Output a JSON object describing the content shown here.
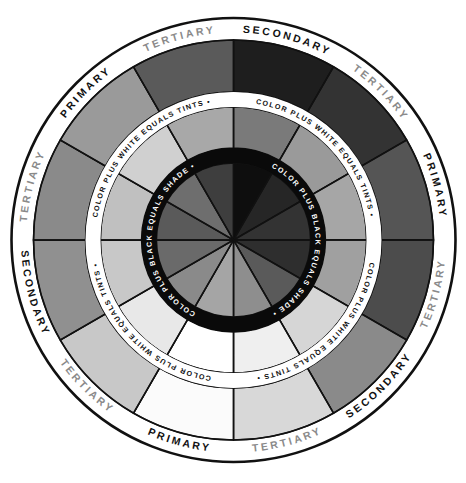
{
  "geometry": {
    "cx": 233.5,
    "cy": 240,
    "r_outer": 222,
    "r_label_inner": 200,
    "r_tint_outer": 148,
    "r_tint_text_inner": 133,
    "r_shade_outer": 92,
    "r_shade_inner": 77
  },
  "outer_labels": [
    {
      "text": "SECONDARY",
      "angle": 15,
      "color": "#111111"
    },
    {
      "text": "TERTIARY",
      "angle": 45,
      "color": "#8a8a8a"
    },
    {
      "text": "PRIMARY",
      "angle": 75,
      "color": "#111111"
    },
    {
      "text": "TERTIARY",
      "angle": 105,
      "color": "#8a8a8a"
    },
    {
      "text": "SECONDARY",
      "angle": 135,
      "color": "#111111"
    },
    {
      "text": "TERTIARY",
      "angle": 165,
      "color": "#8a8a8a"
    },
    {
      "text": "PRIMARY",
      "angle": 195,
      "color": "#111111"
    },
    {
      "text": "TERTIARY",
      "angle": 225,
      "color": "#8a8a8a"
    },
    {
      "text": "SECONDARY",
      "angle": 255,
      "color": "#111111"
    },
    {
      "text": "TERTIARY",
      "angle": 285,
      "color": "#8a8a8a"
    },
    {
      "text": "PRIMARY",
      "angle": 315,
      "color": "#111111"
    },
    {
      "text": "TERTIARY",
      "angle": 345,
      "color": "#8a8a8a"
    }
  ],
  "tint_ring_text": "COLOR PLUS WHITE EQUALS TINTS",
  "shade_ring_text": "COLOR PLUS BLACK EQUALS SHADE",
  "separator": "•",
  "segments": {
    "outer": [
      "#1e1e1e",
      "#333333",
      "#555555",
      "#4c4c4c",
      "#8a8a8a",
      "#d8d8d8",
      "#fbfbfb",
      "#c8c8c8",
      "#909090",
      "#8a8a8a",
      "#9a9a9a",
      "#5a5a5a"
    ],
    "tint": [
      "#7a7a7a",
      "#9a9a9a",
      "#a6a6a6",
      "#a0a0a0",
      "#d6d6d6",
      "#efefef",
      "#ffffff",
      "#e8e8e8",
      "#c8c8c8",
      "#c0c0c0",
      "#d0d0d0",
      "#a8a8a8"
    ],
    "shade": [
      "#0e0e0e",
      "#262626",
      "#333333",
      "#2e2e2e",
      "#5a5a5a",
      "#8e8e8e",
      "#a5a5a5",
      "#8a8a8a",
      "#6a6a6a",
      "#5a5a5a",
      "#6e6e6e",
      "#3e3e3e"
    ]
  },
  "colors": {
    "line": "#111111",
    "ring_white": "#ffffff",
    "ring_black": "#0a0a0a"
  }
}
